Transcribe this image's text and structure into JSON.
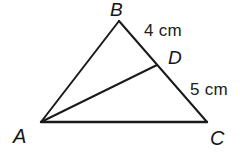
{
  "figure": {
    "type": "geometry-diagram",
    "shape": "triangle-with-cevian",
    "background_color": "#ffffff",
    "stroke_color": "#1a1a1a",
    "stroke_width": 2,
    "canvas": {
      "width": 251,
      "height": 162
    },
    "vertices": [
      {
        "id": "A",
        "label": "A",
        "x": 41,
        "y": 122
      },
      {
        "id": "B",
        "label": "B",
        "x": 119,
        "y": 21
      },
      {
        "id": "C",
        "label": "C",
        "x": 207,
        "y": 122
      },
      {
        "id": "D",
        "label": "D",
        "x": 157,
        "y": 65
      }
    ],
    "segments": [
      {
        "id": "AB",
        "from": "A",
        "to": "B"
      },
      {
        "id": "BC",
        "from": "B",
        "to": "C"
      },
      {
        "id": "CA",
        "from": "C",
        "to": "A"
      },
      {
        "id": "AD",
        "from": "A",
        "to": "D"
      }
    ],
    "measurements": [
      {
        "id": "BD",
        "segment": "BD",
        "text": "4 cm",
        "value": 4,
        "unit": "cm"
      },
      {
        "id": "DC",
        "segment": "DC",
        "text": "5 cm",
        "value": 5,
        "unit": "cm"
      }
    ]
  }
}
